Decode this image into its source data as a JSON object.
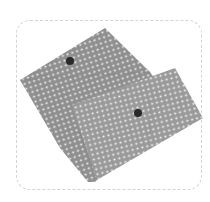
{
  "image": {
    "description": "Two grey polka-dot fabric envelope pouches with snap buttons inside a rounded dashed frame",
    "colors": {
      "fabric": "#8f8f8f",
      "dots": "#f2f2f2",
      "snap": "#2a2a2a",
      "frame": "#d4d4d4",
      "background": "#ffffff"
    }
  }
}
